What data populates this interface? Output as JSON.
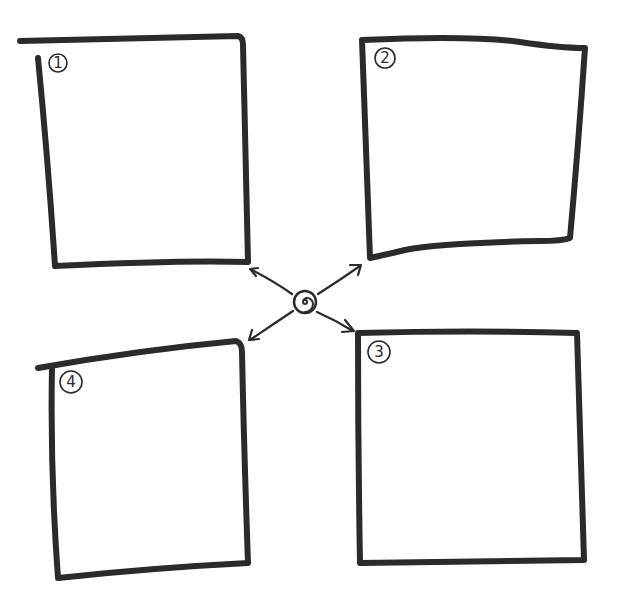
{
  "diagram": {
    "type": "hand-drawn quadrant sketch",
    "stroke_color": "#2b2b2b",
    "background": "#ffffff",
    "center": {
      "name": "spiral-hub",
      "x": 305,
      "y": 302
    },
    "boxes": [
      {
        "id": 1,
        "label": "1",
        "position": "top-left"
      },
      {
        "id": 2,
        "label": "2",
        "position": "top-right"
      },
      {
        "id": 3,
        "label": "3",
        "position": "bottom-right"
      },
      {
        "id": 4,
        "label": "4",
        "position": "bottom-left"
      }
    ],
    "arrows": [
      {
        "from": "center",
        "to": "box-1"
      },
      {
        "from": "center",
        "to": "box-2"
      },
      {
        "from": "center",
        "to": "box-3"
      },
      {
        "from": "center",
        "to": "box-4"
      }
    ]
  }
}
